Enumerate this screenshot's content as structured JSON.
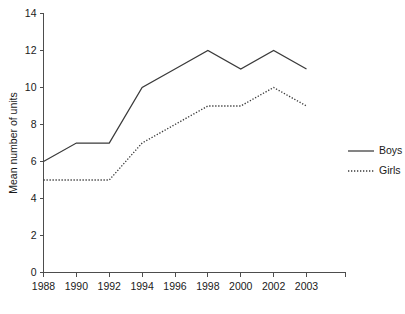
{
  "chart_data": {
    "type": "line",
    "title": "",
    "subtitle": "",
    "xlabel": "",
    "ylabel": "Mean number of units",
    "categories": [
      "1988",
      "1990",
      "1992",
      "1994",
      "1996",
      "1998",
      "2000",
      "2002",
      "2003"
    ],
    "series": [
      {
        "name": "Boys",
        "style": "solid",
        "color": "#3a3a3a",
        "values": [
          6,
          7,
          7,
          10,
          11,
          12,
          11,
          12,
          11
        ]
      },
      {
        "name": "Girls",
        "style": "dotted",
        "color": "#3a3a3a",
        "values": [
          5,
          5,
          5,
          7,
          8,
          9,
          9,
          10,
          9
        ]
      }
    ],
    "ylim": [
      0,
      14
    ],
    "yticks": [
      0,
      2,
      4,
      6,
      8,
      10,
      12,
      14
    ],
    "ytick_labels": [
      "0",
      "2",
      "4",
      "6",
      "8",
      "10",
      "12",
      "14"
    ],
    "grid": false,
    "legend_position": "right",
    "background_color": "#ffffff",
    "axis_color": "#4d4d4d"
  },
  "legend": {
    "entries": [
      {
        "label": "Boys"
      },
      {
        "label": "Girls"
      }
    ]
  }
}
